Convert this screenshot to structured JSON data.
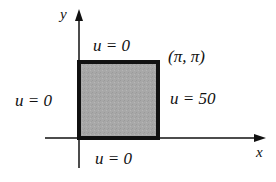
{
  "diagram": {
    "axes": {
      "x_label": "x",
      "y_label": "y"
    },
    "region": {
      "fill_color": "#a9a9a9",
      "border_color": "#111111",
      "corner_label": "(π, π)"
    },
    "boundary_conditions": {
      "top": "u = 0",
      "left": "u = 0",
      "right": "u = 50",
      "bottom": "u = 0"
    }
  }
}
